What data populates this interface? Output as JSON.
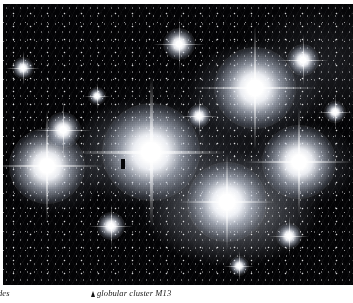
{
  "page": {
    "kind": "scanned-book-page",
    "background_color": "#ffffff"
  },
  "figure": {
    "name": "pleiades-astrophotograph",
    "background_color": "#030305",
    "plate_width": 350,
    "plate_height": 281,
    "bright_stars": [
      {
        "label": "alcyone",
        "x": 148,
        "y": 148,
        "size": 96,
        "spike": 150,
        "core": 46
      },
      {
        "label": "atlas",
        "x": 252,
        "y": 84,
        "size": 80,
        "spike": 124,
        "core": 36
      },
      {
        "label": "electra",
        "x": 44,
        "y": 162,
        "size": 74,
        "spike": 112,
        "core": 32
      },
      {
        "label": "merope",
        "x": 296,
        "y": 158,
        "size": 72,
        "spike": 108,
        "core": 30
      },
      {
        "label": "maia",
        "x": 224,
        "y": 198,
        "size": 78,
        "spike": 96,
        "core": 30
      },
      {
        "label": "taygeta",
        "x": 60,
        "y": 126,
        "size": 34,
        "spike": 58,
        "core": 13
      },
      {
        "label": "pleione",
        "x": 300,
        "y": 56,
        "size": 30,
        "spike": 52,
        "core": 11
      },
      {
        "label": "celaeno",
        "x": 176,
        "y": 40,
        "size": 30,
        "spike": 52,
        "core": 11
      },
      {
        "label": "asterope",
        "x": 108,
        "y": 222,
        "size": 26,
        "spike": 44,
        "core": 10
      },
      {
        "label": "star-j",
        "x": 286,
        "y": 232,
        "size": 24,
        "spike": 40,
        "core": 9
      },
      {
        "label": "star-k",
        "x": 196,
        "y": 112,
        "size": 22,
        "spike": 38,
        "core": 8
      },
      {
        "label": "star-l",
        "x": 20,
        "y": 64,
        "size": 20,
        "spike": 34,
        "core": 7
      },
      {
        "label": "star-m",
        "x": 332,
        "y": 108,
        "size": 20,
        "spike": 34,
        "core": 7
      },
      {
        "label": "star-n",
        "x": 236,
        "y": 262,
        "size": 18,
        "spike": 30,
        "core": 6
      },
      {
        "label": "star-o",
        "x": 94,
        "y": 92,
        "size": 16,
        "spike": 26,
        "core": 6
      }
    ],
    "dust_speck": {
      "x": 120,
      "y": 160,
      "width": 4,
      "height": 10
    }
  },
  "captions": {
    "left": {
      "text": "des",
      "note": "clipped at page edge",
      "marker": null
    },
    "right": {
      "text": "globular cluster M13",
      "marker": "triangle-marker"
    }
  }
}
